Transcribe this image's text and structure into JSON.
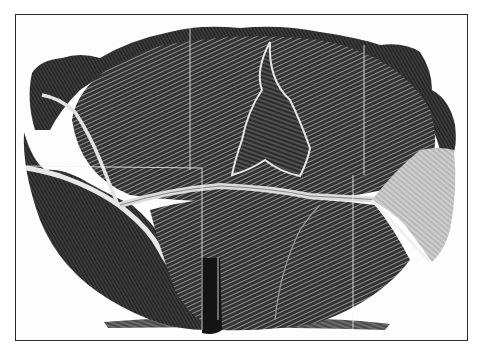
{
  "image": {
    "subject": "Engraved illustration of a cabbage head",
    "style": "black and white wood engraving",
    "colors": {
      "ink": "#1a1a1a",
      "paper": "#fdfdfd",
      "frame": "#2a2a2a",
      "highlight": "#d8d8d8"
    }
  }
}
